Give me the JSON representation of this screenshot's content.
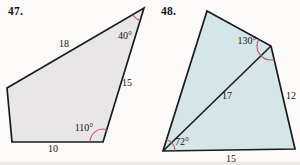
{
  "page": {
    "background": "#fbfaf8"
  },
  "problems": [
    {
      "number": "47.",
      "number_pos": {
        "x": 8,
        "y": 5
      },
      "figure": {
        "type": "quadrilateral",
        "fill": "#e9e6e7",
        "stroke": "#1b1b1b",
        "arc_color": "#c05666",
        "vertices": [
          [
            144,
            8
          ],
          [
            103,
            142
          ],
          [
            12,
            142
          ],
          [
            7,
            88
          ]
        ],
        "diagonals": [],
        "side_labels": [
          {
            "text": "18",
            "x": 64,
            "y": 47
          },
          {
            "text": "15",
            "x": 127,
            "y": 86
          },
          {
            "text": "10",
            "x": 53,
            "y": 152
          }
        ],
        "angle_labels": [
          {
            "text": "40°",
            "x": 125,
            "y": 39
          },
          {
            "text": "110°",
            "x": 84,
            "y": 131
          }
        ],
        "diagonal_labels": [],
        "angle_arcs": [
          {
            "cx": 144,
            "cy": 8,
            "r": 13,
            "start": 107,
            "end": 150
          },
          {
            "cx": 103,
            "cy": 142,
            "r": 13,
            "start": 180,
            "end": 287
          }
        ],
        "given": {
          "sides": [
            18,
            15,
            10
          ],
          "angles_deg": [
            40,
            110
          ]
        }
      }
    },
    {
      "number": "48.",
      "number_pos": {
        "x": 161,
        "y": 5
      },
      "figure": {
        "type": "quadrilateral-with-diagonal",
        "fill": "#d4e6e8",
        "stroke": "#1b1b1b",
        "arc_color": "#c05666",
        "vertices": [
          [
            207,
            11
          ],
          [
            271,
            46
          ],
          [
            295,
            149
          ],
          [
            163,
            151
          ]
        ],
        "diagonals": [
          [
            [
              163,
              151
            ],
            [
              271,
              46
            ]
          ]
        ],
        "side_labels": [
          {
            "text": "12",
            "x": 291,
            "y": 99
          },
          {
            "text": "15",
            "x": 231,
            "y": 162
          }
        ],
        "angle_labels": [
          {
            "text": "130°",
            "x": 247,
            "y": 44
          },
          {
            "text": "72°",
            "x": 182,
            "y": 145
          }
        ],
        "diagonal_labels": [
          {
            "text": "17",
            "x": 227,
            "y": 99
          }
        ],
        "angle_arcs": [
          {
            "cx": 271,
            "cy": 46,
            "r": 14,
            "start": 77,
            "end": 209
          },
          {
            "cx": 163,
            "cy": 151,
            "r": 12,
            "start": -73,
            "end": -1
          }
        ],
        "given": {
          "sides": [
            12,
            15
          ],
          "diagonal": 17,
          "angles_deg": [
            130,
            72
          ]
        }
      }
    }
  ]
}
